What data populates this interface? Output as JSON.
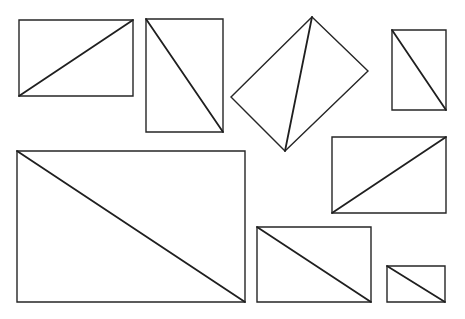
{
  "diagram": {
    "colors": {
      "background": "#ffffff",
      "stroke": "#262626"
    },
    "shapes": [
      {
        "id": "rect-1",
        "kind": "rectangle",
        "points": "19,20 133,20 133,96 19,96",
        "diagonal": [
          19,
          96,
          133,
          20
        ]
      },
      {
        "id": "rect-2",
        "kind": "rectangle",
        "points": "146,19 223,19 223,132 146,132",
        "diagonal": [
          146,
          19,
          223,
          132
        ]
      },
      {
        "id": "rect-3-rotated",
        "kind": "rotated-rectangle",
        "points": "312,17 368,71 285,151 231,97",
        "diagonal": [
          312,
          17,
          285,
          151
        ]
      },
      {
        "id": "rect-4",
        "kind": "rectangle",
        "points": "392,30 446,30 446,110 392,110",
        "diagonal": [
          392,
          30,
          446,
          110
        ]
      },
      {
        "id": "rect-5",
        "kind": "rectangle",
        "points": "17,151 245,151 245,302 17,302",
        "diagonal": [
          17,
          151,
          245,
          302
        ]
      },
      {
        "id": "rect-6",
        "kind": "rectangle",
        "points": "332,137 446,137 446,213 332,213",
        "diagonal": [
          332,
          213,
          446,
          137
        ]
      },
      {
        "id": "rect-7",
        "kind": "rectangle",
        "points": "257,227 371,227 371,302 257,302",
        "diagonal": [
          257,
          227,
          371,
          302
        ]
      },
      {
        "id": "rect-8",
        "kind": "rectangle",
        "points": "387,266 445,266 445,302 387,302",
        "diagonal": [
          387,
          266,
          445,
          302
        ]
      }
    ]
  }
}
